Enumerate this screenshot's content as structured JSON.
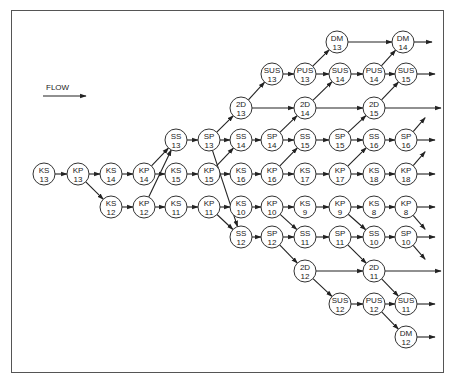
{
  "legend": {
    "label": "FLOW"
  },
  "colors": {
    "line": "#222222",
    "border": "#555555",
    "background": "#ffffff"
  },
  "nodes": [
    {
      "id": "KS13",
      "top": "KS",
      "bottom": "13",
      "x": 44,
      "y": 174
    },
    {
      "id": "KP13",
      "top": "KP",
      "bottom": "13",
      "x": 78,
      "y": 174
    },
    {
      "id": "KS14",
      "top": "KS",
      "bottom": "14",
      "x": 111,
      "y": 174
    },
    {
      "id": "KS12",
      "top": "KS",
      "bottom": "12",
      "x": 111,
      "y": 207
    },
    {
      "id": "KP14",
      "top": "KP",
      "bottom": "14",
      "x": 144,
      "y": 174
    },
    {
      "id": "KP12",
      "top": "KP",
      "bottom": "12",
      "x": 144,
      "y": 207
    },
    {
      "id": "SS13",
      "top": "SS",
      "bottom": "13",
      "x": 176,
      "y": 140
    },
    {
      "id": "KS15",
      "top": "KS",
      "bottom": "15",
      "x": 176,
      "y": 174
    },
    {
      "id": "KS11",
      "top": "KS",
      "bottom": "11",
      "x": 176,
      "y": 207
    },
    {
      "id": "SP13",
      "top": "SP",
      "bottom": "13",
      "x": 209,
      "y": 140
    },
    {
      "id": "KP15",
      "top": "KP",
      "bottom": "15",
      "x": 209,
      "y": 174
    },
    {
      "id": "KP11",
      "top": "KP",
      "bottom": "11",
      "x": 209,
      "y": 207
    },
    {
      "id": "2D13",
      "top": "2D",
      "bottom": "13",
      "x": 241,
      "y": 108
    },
    {
      "id": "SS14",
      "top": "SS",
      "bottom": "14",
      "x": 241,
      "y": 140
    },
    {
      "id": "KS16",
      "top": "KS",
      "bottom": "16",
      "x": 241,
      "y": 174
    },
    {
      "id": "KS10",
      "top": "KS",
      "bottom": "10",
      "x": 241,
      "y": 207
    },
    {
      "id": "SS12",
      "top": "SS",
      "bottom": "12",
      "x": 241,
      "y": 237
    },
    {
      "id": "SUS13",
      "top": "SUS",
      "bottom": "13",
      "x": 272,
      "y": 74
    },
    {
      "id": "SP14",
      "top": "SP",
      "bottom": "14",
      "x": 272,
      "y": 140
    },
    {
      "id": "KP16",
      "top": "KP",
      "bottom": "16",
      "x": 272,
      "y": 174
    },
    {
      "id": "KP10",
      "top": "KP",
      "bottom": "10",
      "x": 272,
      "y": 207
    },
    {
      "id": "SP12",
      "top": "SP",
      "bottom": "12",
      "x": 272,
      "y": 237
    },
    {
      "id": "PUS13",
      "top": "PUS",
      "bottom": "13",
      "x": 305,
      "y": 74
    },
    {
      "id": "2D14",
      "top": "2D",
      "bottom": "14",
      "x": 305,
      "y": 108
    },
    {
      "id": "SS15",
      "top": "SS",
      "bottom": "15",
      "x": 305,
      "y": 140
    },
    {
      "id": "KS17",
      "top": "KS",
      "bottom": "17",
      "x": 305,
      "y": 174
    },
    {
      "id": "KS9",
      "top": "KS",
      "bottom": "9",
      "x": 305,
      "y": 207
    },
    {
      "id": "SS11",
      "top": "SS",
      "bottom": "11",
      "x": 305,
      "y": 237
    },
    {
      "id": "2D12",
      "top": "2D",
      "bottom": "12",
      "x": 305,
      "y": 271
    },
    {
      "id": "DM13",
      "top": "DM",
      "bottom": "13",
      "x": 337,
      "y": 42
    },
    {
      "id": "SUS14",
      "top": "SUS",
      "bottom": "14",
      "x": 340,
      "y": 74
    },
    {
      "id": "SP15",
      "top": "SP",
      "bottom": "15",
      "x": 340,
      "y": 140
    },
    {
      "id": "KP17",
      "top": "KP",
      "bottom": "17",
      "x": 340,
      "y": 174
    },
    {
      "id": "KP9",
      "top": "KP",
      "bottom": "9",
      "x": 340,
      "y": 207
    },
    {
      "id": "SP11",
      "top": "SP",
      "bottom": "11",
      "x": 340,
      "y": 237
    },
    {
      "id": "SUS12",
      "top": "SUS",
      "bottom": "12",
      "x": 340,
      "y": 304
    },
    {
      "id": "PUS14",
      "top": "PUS",
      "bottom": "14",
      "x": 374,
      "y": 74
    },
    {
      "id": "2D15",
      "top": "2D",
      "bottom": "15",
      "x": 374,
      "y": 108
    },
    {
      "id": "SS16",
      "top": "SS",
      "bottom": "16",
      "x": 374,
      "y": 140
    },
    {
      "id": "KS18",
      "top": "KS",
      "bottom": "18",
      "x": 374,
      "y": 174
    },
    {
      "id": "KS8",
      "top": "KS",
      "bottom": "8",
      "x": 374,
      "y": 207
    },
    {
      "id": "SS10",
      "top": "SS",
      "bottom": "10",
      "x": 374,
      "y": 237
    },
    {
      "id": "2D11",
      "top": "2D",
      "bottom": "11",
      "x": 374,
      "y": 271
    },
    {
      "id": "PUS12",
      "top": "PUS",
      "bottom": "12",
      "x": 374,
      "y": 304
    },
    {
      "id": "DM14",
      "top": "DM",
      "bottom": "14",
      "x": 403,
      "y": 42
    },
    {
      "id": "SUS15",
      "top": "SUS",
      "bottom": "15",
      "x": 406,
      "y": 74
    },
    {
      "id": "SP16",
      "top": "SP",
      "bottom": "16",
      "x": 406,
      "y": 140
    },
    {
      "id": "KP18",
      "top": "KP",
      "bottom": "18",
      "x": 406,
      "y": 174
    },
    {
      "id": "KP8",
      "top": "KP",
      "bottom": "8",
      "x": 406,
      "y": 207
    },
    {
      "id": "SP10",
      "top": "SP",
      "bottom": "10",
      "x": 406,
      "y": 237
    },
    {
      "id": "SUS11",
      "top": "SUS",
      "bottom": "11",
      "x": 406,
      "y": 304
    },
    {
      "id": "DM12",
      "top": "DM",
      "bottom": "12",
      "x": 406,
      "y": 337
    }
  ],
  "edges": [
    [
      "KS13",
      "KP13"
    ],
    [
      "KP13",
      "KS14"
    ],
    [
      "KP13",
      "KS12"
    ],
    [
      "KS14",
      "KP14"
    ],
    [
      "KS12",
      "KP12"
    ],
    [
      "KP14",
      "SS13"
    ],
    [
      "KP12",
      "SS13"
    ],
    [
      "KP14",
      "KS15"
    ],
    [
      "KP12",
      "KS11"
    ],
    [
      "SS13",
      "SP13"
    ],
    [
      "KS15",
      "KP15"
    ],
    [
      "KS11",
      "KP11"
    ],
    [
      "SP13",
      "2D13"
    ],
    [
      "SP13",
      "SS14"
    ],
    [
      "SP13",
      "SS12"
    ],
    [
      "KP15",
      "SS14"
    ],
    [
      "KP15",
      "KS16"
    ],
    [
      "KP11",
      "KS10"
    ],
    [
      "KP11",
      "SS12"
    ],
    [
      "2D13",
      "SUS13"
    ],
    [
      "2D13",
      "2D14"
    ],
    [
      "SS14",
      "SP14"
    ],
    [
      "KS16",
      "KP16"
    ],
    [
      "KS10",
      "KP10"
    ],
    [
      "SS12",
      "SP12"
    ],
    [
      "SUS13",
      "PUS13"
    ],
    [
      "SP14",
      "2D14"
    ],
    [
      "SP14",
      "SS15"
    ],
    [
      "KP16",
      "SS15"
    ],
    [
      "KP16",
      "KS17"
    ],
    [
      "KP10",
      "KS9"
    ],
    [
      "KP10",
      "SS11"
    ],
    [
      "SP12",
      "SS11"
    ],
    [
      "SP12",
      "2D12"
    ],
    [
      "PUS13",
      "DM13"
    ],
    [
      "PUS13",
      "SUS14"
    ],
    [
      "2D14",
      "SUS14"
    ],
    [
      "2D14",
      "2D15"
    ],
    [
      "SS15",
      "SP15"
    ],
    [
      "KS17",
      "KP17"
    ],
    [
      "KS9",
      "KP9"
    ],
    [
      "SS11",
      "SP11"
    ],
    [
      "2D12",
      "2D11"
    ],
    [
      "2D12",
      "SUS12"
    ],
    [
      "DM13",
      "DM14"
    ],
    [
      "SUS14",
      "PUS14"
    ],
    [
      "SP15",
      "2D15"
    ],
    [
      "SP15",
      "SS16"
    ],
    [
      "KP17",
      "SS16"
    ],
    [
      "KP17",
      "KS18"
    ],
    [
      "KP9",
      "KS8"
    ],
    [
      "KP9",
      "SS10"
    ],
    [
      "SP11",
      "SS10"
    ],
    [
      "SP11",
      "2D11"
    ],
    [
      "SUS12",
      "PUS12"
    ],
    [
      "PUS14",
      "DM14"
    ],
    [
      "PUS14",
      "SUS15"
    ],
    [
      "2D15",
      "SUS15"
    ],
    [
      "SS16",
      "SP16"
    ],
    [
      "KS18",
      "KP18"
    ],
    [
      "KS8",
      "KP8"
    ],
    [
      "SS10",
      "SP10"
    ],
    [
      "2D11",
      "SUS11"
    ],
    [
      "PUS12",
      "SUS11"
    ],
    [
      "PUS12",
      "DM12"
    ]
  ],
  "exits": [
    {
      "from": "DM14",
      "dx": 18,
      "dy": 0
    },
    {
      "from": "SUS15",
      "dx": 18,
      "dy": 0
    },
    {
      "from": "2D15",
      "dx": 56,
      "dy": 0
    },
    {
      "from": "SP16",
      "dx": 18,
      "dy": 0
    },
    {
      "from": "SP16",
      "dx": 12,
      "dy": -14
    },
    {
      "from": "KP18",
      "dx": 18,
      "dy": 0
    },
    {
      "from": "KP18",
      "dx": 12,
      "dy": -14
    },
    {
      "from": "KP8",
      "dx": 18,
      "dy": 0
    },
    {
      "from": "KP8",
      "dx": 12,
      "dy": 14
    },
    {
      "from": "SP10",
      "dx": 18,
      "dy": 0
    },
    {
      "from": "SP10",
      "dx": 12,
      "dy": 14
    },
    {
      "from": "2D11",
      "dx": 56,
      "dy": 0
    },
    {
      "from": "SUS11",
      "dx": 18,
      "dy": 0
    },
    {
      "from": "DM12",
      "dx": 18,
      "dy": 0
    }
  ]
}
